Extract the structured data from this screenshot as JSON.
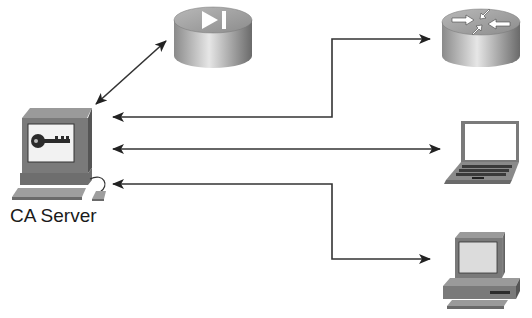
{
  "diagram": {
    "type": "network-diagram",
    "nodes": [
      {
        "id": "ca_server",
        "label": "CA Server",
        "icon": "pc-with-key-icon"
      },
      {
        "id": "vpn_concentrator",
        "label": "",
        "icon": "vpn-concentrator-icon"
      },
      {
        "id": "router",
        "label": "",
        "icon": "router-icon"
      },
      {
        "id": "laptop",
        "label": "",
        "icon": "laptop-icon"
      },
      {
        "id": "workstation",
        "label": "",
        "icon": "workstation-pc-icon"
      }
    ],
    "edges": [
      {
        "from": "ca_server",
        "to": "vpn_concentrator",
        "direction": "bidirectional",
        "style": "diagonal"
      },
      {
        "from": "ca_server",
        "to": "router",
        "direction": "bidirectional",
        "style": "elbow-up"
      },
      {
        "from": "ca_server",
        "to": "laptop",
        "direction": "bidirectional",
        "style": "straight"
      },
      {
        "from": "ca_server",
        "to": "workstation",
        "direction": "bidirectional",
        "style": "elbow-down"
      }
    ],
    "colors": {
      "line": "#333333",
      "device_dark": "#6e6e6e",
      "device_mid": "#a8a8a8",
      "device_light": "#d9d9d9",
      "background": "#ffffff"
    }
  }
}
